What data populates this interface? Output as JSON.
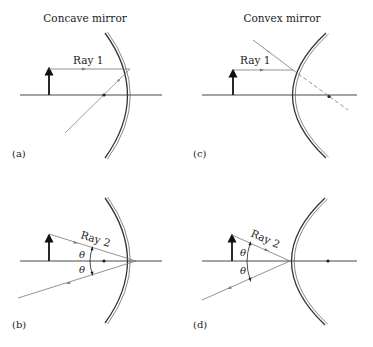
{
  "titles": {
    "left": "Concave mirror",
    "right": "Convex mirror"
  },
  "panels": {
    "a": {
      "label": "(a)",
      "ray_label": "Ray 1",
      "mirror": "concave"
    },
    "b": {
      "label": "(b)",
      "ray_label": "Ray 2",
      "mirror": "concave",
      "angle_symbols": [
        "θ",
        "θ"
      ]
    },
    "c": {
      "label": "(c)",
      "ray_label": "Ray 1",
      "mirror": "convex"
    },
    "d": {
      "label": "(d)",
      "ray_label": "Ray 2",
      "mirror": "convex",
      "angle_symbols": [
        "θ",
        "θ"
      ]
    }
  },
  "colors": {
    "line": "#333333",
    "ray": "#777777",
    "object_arrow": "#111111"
  }
}
